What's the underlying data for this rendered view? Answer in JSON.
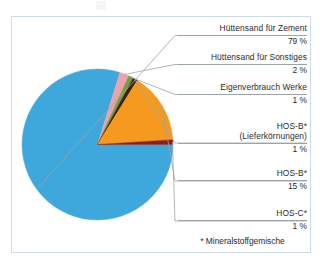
{
  "figure": {
    "frame_color": "#c9dce8",
    "background": "#ffffff",
    "footnote": "* Mineralstoffgemische"
  },
  "chart_data": {
    "type": "pie",
    "title": "",
    "xlabel": "",
    "ylabel": "",
    "unit": "%",
    "legend_position": "callout-right",
    "grid": false,
    "start_angle_deg": 0,
    "direction": "clockwise",
    "categories": [
      "Hüttensand für Zement",
      "Hüttensand für Sonstiges",
      "Eigenverbrauch Werke",
      "HOS-B* (Lieferkörnungen)",
      "HOS-B*",
      "HOS-C*"
    ],
    "values": [
      79,
      2,
      1,
      1,
      15,
      1
    ],
    "value_labels": [
      "79 %",
      "2 %",
      "1 %",
      "1 %",
      "15 %",
      "1 %"
    ],
    "colors": [
      "#3ea7dc",
      "#e9a3ab",
      "#7d9b3e",
      "#3a2414",
      "#f59a1e",
      "#8f1d18"
    ],
    "slices": [
      {
        "name": "Hüttensand für Zement",
        "label_line1": "Hüttensand für Zement",
        "label_line2": "",
        "value": 79,
        "value_label": "79 %",
        "color": "#3ea7dc"
      },
      {
        "name": "Hüttensand für Sonstiges",
        "label_line1": "Hüttensand für Sonstiges",
        "label_line2": "",
        "value": 2,
        "value_label": "2 %",
        "color": "#e9a3ab"
      },
      {
        "name": "Eigenverbrauch Werke",
        "label_line1": "Eigenverbrauch Werke",
        "label_line2": "",
        "value": 1,
        "value_label": "1 %",
        "color": "#7d9b3e"
      },
      {
        "name": "HOS-B* (Lieferkörnungen)",
        "label_line1": "HOS-B*",
        "label_line2": "(Lieferkörnungen)",
        "value": 1,
        "value_label": "1 %",
        "color": "#3a2414"
      },
      {
        "name": "HOS-B*",
        "label_line1": "HOS-B*",
        "label_line2": "",
        "value": 15,
        "value_label": "15 %",
        "color": "#f59a1e"
      },
      {
        "name": "HOS-C*",
        "label_line1": "HOS-C*",
        "label_line2": "",
        "value": 1,
        "value_label": "1 %",
        "color": "#8f1d18"
      }
    ]
  }
}
